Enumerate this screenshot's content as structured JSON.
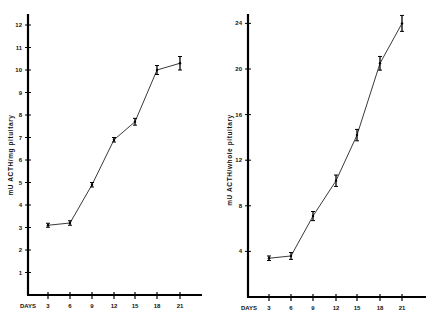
{
  "chart_data": [
    {
      "type": "line",
      "title": "",
      "xlabel": "DAYS",
      "ylabel": "mU ACTH/mg pituitary",
      "x": [
        3,
        6,
        9,
        12,
        15,
        18,
        21
      ],
      "series": [
        {
          "name": "ACTH per mg pituitary",
          "values": [
            3.1,
            3.2,
            4.9,
            6.9,
            7.7,
            10.0,
            10.3
          ],
          "errors": [
            0.05,
            0.1,
            0.1,
            0.1,
            0.15,
            0.2,
            0.3
          ]
        }
      ],
      "xticks": [
        "3",
        "6",
        "9",
        "12",
        "15",
        "18",
        "21"
      ],
      "yticks": [
        "1",
        "2",
        "3",
        "4",
        "5",
        "6",
        "7",
        "8",
        "9",
        "10",
        "11",
        "12"
      ],
      "ylim": [
        0,
        12.5
      ],
      "grid": false
    },
    {
      "type": "line",
      "title": "",
      "xlabel": "DAYS",
      "ylabel": "mU ACTH/whole pituitary",
      "x": [
        3,
        6,
        9,
        12,
        15,
        18,
        21
      ],
      "series": [
        {
          "name": "ACTH per whole pituitary",
          "values": [
            3.4,
            3.6,
            7.1,
            10.2,
            14.2,
            20.5,
            24.0
          ],
          "errors": [
            0.2,
            0.3,
            0.4,
            0.5,
            0.5,
            0.6,
            0.7
          ]
        }
      ],
      "xticks": [
        "3",
        "6",
        "9",
        "12",
        "15",
        "18",
        "21"
      ],
      "yticks": [
        "4",
        "8",
        "12",
        "16",
        "20",
        "24"
      ],
      "ylim": [
        0,
        25
      ],
      "grid": false
    }
  ]
}
